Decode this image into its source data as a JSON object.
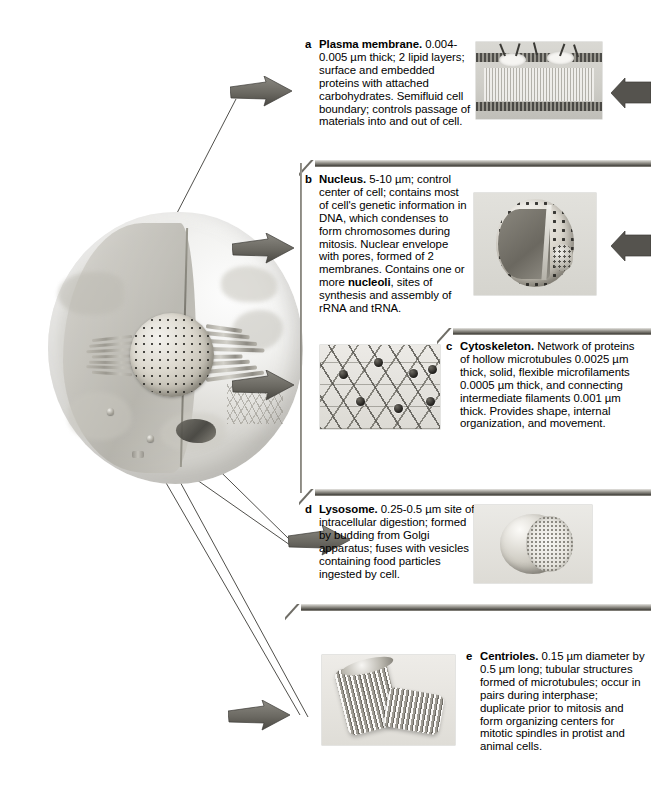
{
  "figure": {
    "background": "#ffffff",
    "arrow_color": "#6e6c66",
    "separator_color": "#4e4c47"
  },
  "panels": [
    {
      "letter": "a",
      "term": "Plasma membrane.",
      "description": " 0.004-0.005 µm thick; 2 lipid layers; surface and embedded proteins with attached carbohydrates. Semifluid cell boundary; controls passage of materials into and out of cell.",
      "thumb_name": "plasma-membrane-illustration"
    },
    {
      "letter": "b",
      "term": "Nucleus.",
      "description": " 5-10 µm; control center of cell; contains most of cell's genetic information in DNA, which condenses to form chromosomes during mitosis. Nuclear envelope with pores, formed of 2 membranes. Contains one or more ",
      "emphasis": "nucleoli",
      "description_tail": ", sites of synthesis and assembly of rRNA and tRNA.",
      "thumb_name": "nucleus-illustration"
    },
    {
      "letter": "c",
      "term": "Cytoskeleton.",
      "description": " Network of proteins of hollow microtubules 0.0025 µm thick, solid, flexible microfilaments 0.0005 µm thick, and connecting intermediate filaments 0.001 µm thick. Provides shape, internal organization, and movement.",
      "thumb_name": "cytoskeleton-illustration"
    },
    {
      "letter": "d",
      "term": "Lysosome.",
      "description": " 0.25-0.5 µm site of intracellular digestion; formed by budding from Golgi apparatus; fuses with vesicles containing food particles ingested by cell.",
      "thumb_name": "lysosome-illustration"
    },
    {
      "letter": "e",
      "term": "Centrioles.",
      "description": "  0.15 µm diameter by 0.5 µm long; tubular structures formed of microtubules; occur in pairs during interphase; duplicate prior to mitosis and form organizing centers for mitotic spindles in protist and animal cells.",
      "thumb_name": "centrioles-illustration"
    }
  ],
  "cell": {
    "label": "Animal cell cut-away illustration",
    "structures": [
      "nucleus",
      "rough-endoplasmic-reticulum",
      "golgi-apparatus",
      "mitochondrion",
      "cytoskeleton",
      "lysosome",
      "centriole",
      "plasma-membrane"
    ]
  }
}
